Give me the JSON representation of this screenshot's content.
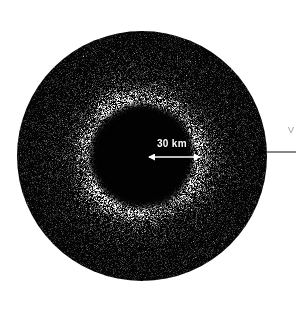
{
  "figure": {
    "title": "",
    "background_color": "#ffffff",
    "width": 296,
    "height": 311
  },
  "annotations": {
    "scale_bar": {
      "label": "30 km",
      "color": "#ffffff",
      "arrow_style": "double-headed",
      "x_start": 149,
      "x_end": 200,
      "y": 157,
      "label_x": 157,
      "label_y": 139
    },
    "edge_pointer": {
      "label": "",
      "color": "#000000",
      "arrow_style": "single-headed-left",
      "x_start": 296,
      "x_end": 266,
      "y": 152
    },
    "edge_clipped_text": {
      "label": "V",
      "color": "#9a9a9a",
      "x": 288,
      "y": 126
    }
  },
  "chart_data": {
    "type": "scatter",
    "title": "",
    "xlabel": "",
    "ylabel": "",
    "grid": false,
    "legend": null,
    "background_color": "#ffffff",
    "point_color": "#ffffff",
    "field_color": "#050505",
    "disk": {
      "center_x": 142,
      "center_y": 156,
      "outer_radius": 125,
      "inner_cavity_radius": 45,
      "bright_ring_inner_radius": 47,
      "bright_ring_peak_radius": 60,
      "bright_ring_outer_radius": 82
    },
    "radial_profile": {
      "r": [
        0,
        10,
        20,
        30,
        40,
        45,
        50,
        55,
        60,
        70,
        80,
        90,
        100,
        110,
        120,
        125
      ],
      "density": [
        0,
        0,
        0,
        0,
        0.02,
        0.15,
        0.85,
        1.0,
        0.95,
        0.6,
        0.42,
        0.36,
        0.33,
        0.3,
        0.28,
        0.25
      ],
      "brightness": [
        0,
        0,
        0,
        0,
        0.05,
        0.4,
        1.0,
        1.0,
        0.9,
        0.5,
        0.3,
        0.24,
        0.2,
        0.18,
        0.16,
        0.14
      ]
    },
    "n_points": 52000,
    "scale_reference_km": 30
  }
}
